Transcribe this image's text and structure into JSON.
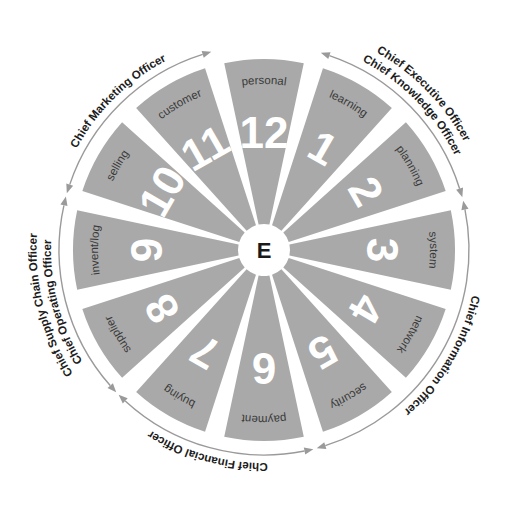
{
  "diagram": {
    "center_label": "E",
    "colors": {
      "sector_fill": "#a9a9a9",
      "spoke": "#ffffff",
      "number": "#ffffff",
      "topic": "#3a3a3a",
      "role": "#1c1c1c",
      "arrow": "#9a9a9a",
      "background": "#ffffff"
    },
    "geometry": {
      "center_x": 264,
      "center_y": 250,
      "radius": 191,
      "sector_count": 12
    },
    "sectors": [
      {
        "number": "1",
        "topic": "learning"
      },
      {
        "number": "2",
        "topic": "planning"
      },
      {
        "number": "3",
        "topic": "system"
      },
      {
        "number": "4",
        "topic": "network"
      },
      {
        "number": "5",
        "topic": "security"
      },
      {
        "number": "6",
        "topic": "payment"
      },
      {
        "number": "7",
        "topic": "buying"
      },
      {
        "number": "8",
        "topic": "supplier"
      },
      {
        "number": "9",
        "topic": "invent/log"
      },
      {
        "number": "10",
        "topic": "selling"
      },
      {
        "number": "11",
        "topic": "customer"
      },
      {
        "number": "12",
        "topic": "personal"
      }
    ],
    "roles": [
      {
        "label": "Chief Knowledge Officer",
        "spans": "1-2"
      },
      {
        "label": "Chief Executive Officer",
        "spans": "1-2"
      },
      {
        "label": "Chief Information Officer",
        "spans": "3-5"
      },
      {
        "label": "Chief Financial Officer",
        "spans": "6-7"
      },
      {
        "label": "Chief Operating Officer",
        "spans": "8-9"
      },
      {
        "label": "Chief Supply Chain Officer",
        "spans": "8-9"
      },
      {
        "label": "Chief Marketing Officer",
        "spans": "10-11"
      }
    ]
  }
}
